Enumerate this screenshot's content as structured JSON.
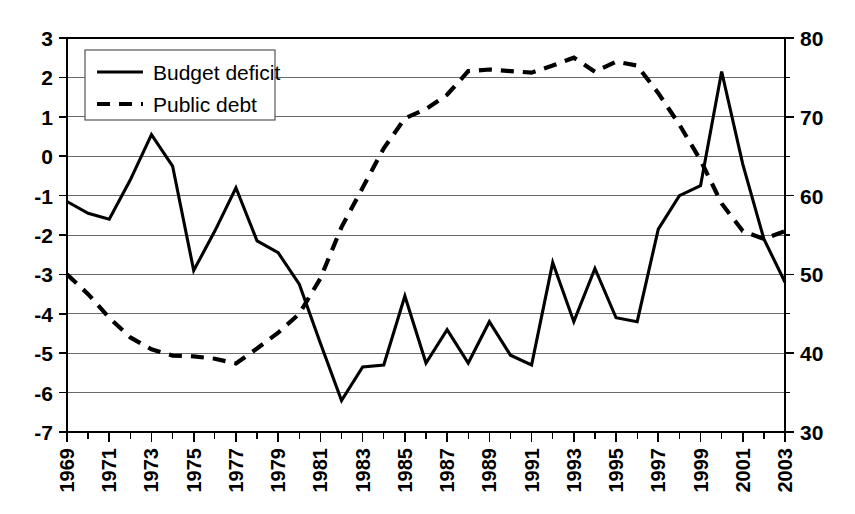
{
  "chart_data": {
    "type": "line",
    "title": "",
    "subtitle": "",
    "xlabel": "",
    "ylabel": "",
    "y2label": "",
    "grid": true,
    "legend_position": "top-left",
    "x": [
      1969,
      1970,
      1971,
      1972,
      1973,
      1974,
      1975,
      1976,
      1977,
      1978,
      1979,
      1980,
      1981,
      1982,
      1983,
      1984,
      1985,
      1986,
      1987,
      1988,
      1989,
      1990,
      1991,
      1992,
      1993,
      1994,
      1995,
      1996,
      1997,
      1998,
      1999,
      2000,
      2001,
      2002,
      2003
    ],
    "xlim": [
      1969,
      2003
    ],
    "ylim": [
      -7,
      3
    ],
    "y2lim": [
      30,
      80
    ],
    "yticks": [
      3,
      2,
      1,
      0,
      -1,
      -2,
      -3,
      -4,
      -5,
      -6,
      -7
    ],
    "ytick_labels": [
      "3",
      "2",
      "1",
      "0",
      "-1",
      "-2",
      "-3",
      "-4",
      "-5",
      "-6",
      "-7"
    ],
    "y2ticks": [
      80,
      70,
      60,
      50,
      40,
      30
    ],
    "y2tick_labels": [
      "80",
      "70",
      "60",
      "50",
      "40",
      "30"
    ],
    "y2_minor_ticks": [
      75,
      65,
      55,
      45,
      35
    ],
    "xtick_labels": [
      "1969",
      "1971",
      "1973",
      "1975",
      "1977",
      "1979",
      "1981",
      "1983",
      "1985",
      "1987",
      "1989",
      "1991",
      "1993",
      "1995",
      "1997",
      "1999",
      "2001",
      "2003"
    ],
    "xtick_values": [
      1969,
      1971,
      1973,
      1975,
      1977,
      1979,
      1981,
      1983,
      1985,
      1987,
      1989,
      1991,
      1993,
      1995,
      1997,
      1999,
      2001,
      2003
    ],
    "series": [
      {
        "name": "Budget deficit",
        "axis": "left",
        "style": "solid",
        "color": "#000000",
        "values": [
          -1.15,
          -1.45,
          -1.6,
          -0.6,
          0.55,
          -0.25,
          -2.9,
          -1.9,
          -0.8,
          -2.15,
          -2.45,
          -3.25,
          -4.75,
          -6.2,
          -5.35,
          -5.3,
          -3.55,
          -5.25,
          -4.4,
          -5.25,
          -4.2,
          -5.05,
          -5.3,
          -2.7,
          -4.2,
          -2.85,
          -4.1,
          -4.2,
          -1.85,
          -1.0,
          -0.75,
          2.15,
          -0.2,
          -2.1,
          -3.2
        ]
      },
      {
        "name": "Public debt",
        "axis": "right",
        "style": "dashed",
        "color": "#000000",
        "values": [
          50.0,
          47.5,
          44.5,
          42.0,
          40.5,
          39.7,
          39.6,
          39.3,
          38.7,
          40.6,
          42.6,
          45.0,
          49.5,
          56.0,
          61.0,
          66.0,
          69.8,
          71.0,
          72.8,
          75.8,
          76.0,
          75.8,
          75.6,
          76.5,
          77.5,
          75.7,
          77.0,
          76.5,
          73.0,
          69.0,
          64.5,
          59.0,
          55.5,
          54.5,
          55.5
        ]
      }
    ],
    "legend_entries": [
      {
        "label": "Budget deficit",
        "style": "solid"
      },
      {
        "label": "Public debt",
        "style": "dashed"
      }
    ]
  }
}
